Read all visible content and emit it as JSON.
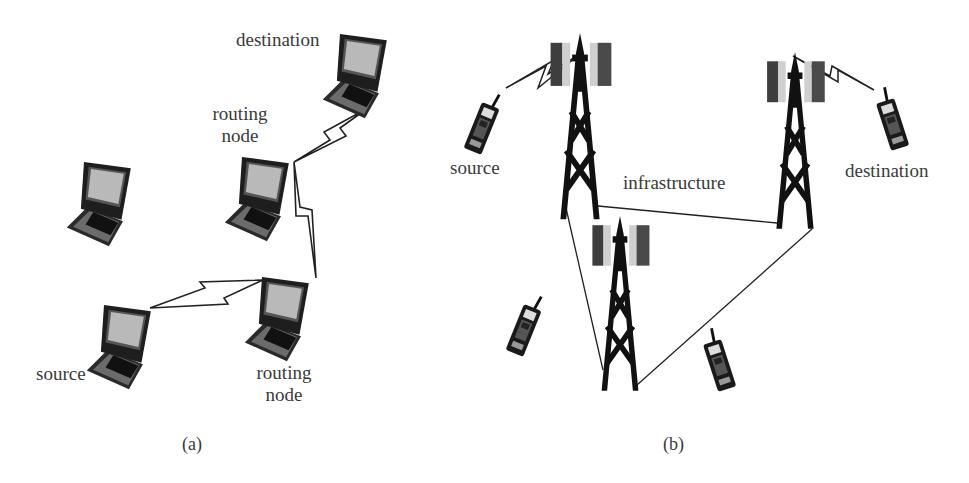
{
  "panel_a": {
    "caption": "(a)",
    "labels": {
      "destination": "destination",
      "routing_node_top_line1": "routing",
      "routing_node_top_line2": "node",
      "source": "source",
      "routing_node_bottom_line1": "routing",
      "routing_node_bottom_line2": "node"
    },
    "nodes": [
      {
        "id": "destination",
        "type": "laptop-icon"
      },
      {
        "id": "routing-node-1",
        "type": "laptop-icon"
      },
      {
        "id": "idle-node",
        "type": "laptop-icon"
      },
      {
        "id": "source",
        "type": "laptop-icon"
      },
      {
        "id": "routing-node-2",
        "type": "laptop-icon"
      }
    ],
    "links": [
      {
        "from": "source",
        "to": "routing-node-2",
        "kind": "wireless"
      },
      {
        "from": "routing-node-2",
        "to": "routing-node-1",
        "kind": "wireless"
      },
      {
        "from": "routing-node-1",
        "to": "destination",
        "kind": "wireless"
      }
    ]
  },
  "panel_b": {
    "caption": "(b)",
    "labels": {
      "source": "source",
      "infrastructure": "infrastructure",
      "destination": "destination"
    },
    "nodes": [
      {
        "id": "source-phone",
        "type": "cellphone-icon"
      },
      {
        "id": "tower-1",
        "type": "cell-tower-icon"
      },
      {
        "id": "tower-2",
        "type": "cell-tower-icon"
      },
      {
        "id": "tower-3",
        "type": "cell-tower-icon"
      },
      {
        "id": "destination-phone",
        "type": "cellphone-icon"
      },
      {
        "id": "idle-phone-1",
        "type": "cellphone-icon"
      },
      {
        "id": "idle-phone-2",
        "type": "cellphone-icon"
      }
    ],
    "links": [
      {
        "from": "source-phone",
        "to": "tower-1",
        "kind": "wireless"
      },
      {
        "from": "tower-2",
        "to": "destination-phone",
        "kind": "wireless"
      },
      {
        "from": "tower-1",
        "to": "tower-2",
        "kind": "wired"
      },
      {
        "from": "tower-1",
        "to": "tower-3",
        "kind": "wired"
      },
      {
        "from": "tower-3",
        "to": "tower-2",
        "kind": "wired"
      }
    ]
  }
}
